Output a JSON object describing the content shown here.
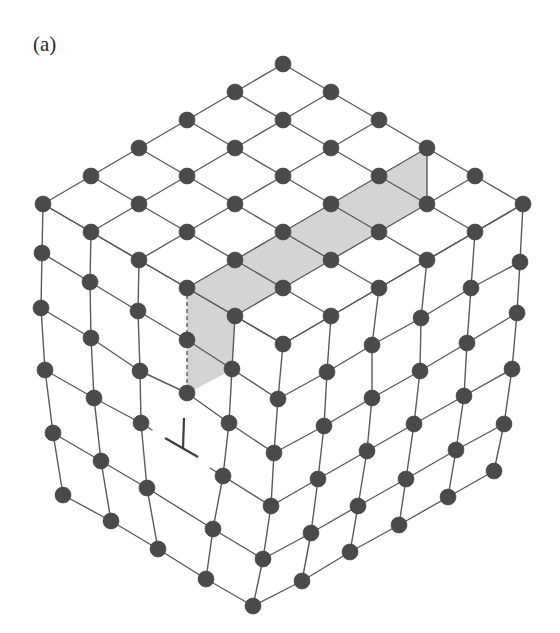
{
  "figure": {
    "panel_label": "(a)",
    "dislocation_symbol": "⊥"
  },
  "colors": {
    "atom": "#4a4a4a",
    "bond": "#5a5a5a",
    "half_plane_shade": "#d4d4d4",
    "background": "#ffffff"
  },
  "lattice": {
    "atom_radius": 8,
    "top_face": {
      "origin": [
        283,
        64
      ],
      "step_i": [
        -48,
        28
      ],
      "step_j": [
        48,
        28
      ],
      "size": 6
    },
    "left_face_rows": [
      [
        [
          43,
          204
        ],
        [
          91,
          232
        ],
        [
          139,
          260
        ],
        [
          187,
          288
        ],
        [
          235,
          316
        ],
        [
          283,
          344
        ]
      ],
      [
        [
          42,
          253
        ],
        [
          90,
          282
        ],
        [
          138,
          311
        ],
        [
          187,
          340
        ],
        [
          232,
          369
        ],
        [
          278,
          399
        ]
      ],
      [
        [
          41,
          308
        ],
        [
          91,
          338
        ],
        [
          140,
          371
        ],
        [
          187,
          393
        ],
        [
          229,
          423
        ],
        [
          274,
          453
        ]
      ],
      [
        [
          45,
          370
        ],
        [
          94,
          398
        ],
        [
          141,
          423
        ]
      ],
      [
        [
          223,
          476
        ],
        [
          271,
          506
        ]
      ],
      [
        [
          53,
          433
        ],
        [
          101,
          461
        ],
        [
          147,
          488
        ],
        [
          213,
          529
        ],
        [
          263,
          559
        ]
      ],
      [
        [
          63,
          495
        ],
        [
          111,
          521
        ],
        [
          158,
          549
        ],
        [
          206,
          579
        ],
        [
          253,
          606
        ]
      ]
    ],
    "left_face_columns": [
      [
        [
          43,
          204
        ],
        [
          42,
          253
        ],
        [
          41,
          308
        ],
        [
          45,
          370
        ],
        [
          53,
          433
        ],
        [
          63,
          495
        ]
      ],
      [
        [
          91,
          232
        ],
        [
          90,
          282
        ],
        [
          91,
          338
        ],
        [
          94,
          398
        ],
        [
          101,
          461
        ],
        [
          111,
          521
        ]
      ],
      [
        [
          139,
          260
        ],
        [
          138,
          311
        ],
        [
          140,
          371
        ],
        [
          141,
          423
        ],
        [
          147,
          488
        ],
        [
          158,
          549
        ]
      ],
      [
        [
          235,
          316
        ],
        [
          232,
          369
        ],
        [
          229,
          423
        ],
        [
          223,
          476
        ],
        [
          213,
          529
        ],
        [
          206,
          579
        ]
      ]
    ],
    "half_plane_column": [
      [
        187,
        288
      ],
      [
        187,
        340
      ],
      [
        187,
        393
      ]
    ],
    "stubs": [
      [
        [
          141,
          423
        ],
        [
          152,
          430
        ]
      ],
      [
        [
          223,
          476
        ],
        [
          210,
          468
        ]
      ]
    ],
    "right_face_rows": [
      [
        [
          283,
          344
        ],
        [
          331,
          316
        ],
        [
          379,
          288
        ],
        [
          427,
          260
        ],
        [
          475,
          232
        ],
        [
          523,
          204
        ]
      ],
      [
        [
          278,
          399
        ],
        [
          327,
          372
        ],
        [
          372,
          345
        ],
        [
          421,
          318
        ],
        [
          471,
          288
        ],
        [
          520,
          262
        ]
      ],
      [
        [
          274,
          453
        ],
        [
          324,
          426
        ],
        [
          372,
          398
        ],
        [
          420,
          371
        ],
        [
          467,
          343
        ],
        [
          517,
          313
        ]
      ],
      [
        [
          271,
          506
        ],
        [
          318,
          479
        ],
        [
          367,
          451
        ],
        [
          414,
          424
        ],
        [
          464,
          396
        ],
        [
          512,
          369
        ]
      ],
      [
        [
          263,
          559
        ],
        [
          311,
          533
        ],
        [
          358,
          506
        ],
        [
          406,
          479
        ],
        [
          456,
          450
        ],
        [
          504,
          424
        ]
      ],
      [
        [
          253,
          606
        ],
        [
          302,
          581
        ],
        [
          350,
          552
        ],
        [
          399,
          525
        ],
        [
          448,
          497
        ],
        [
          494,
          471
        ]
      ]
    ],
    "half_plane_regions": [
      [
        [
          427,
          148
        ],
        [
          427,
          204
        ],
        [
          235,
          316
        ],
        [
          187,
          288
        ],
        [
          379,
          176
        ]
      ],
      [
        [
          187,
          288
        ],
        [
          235,
          316
        ],
        [
          232,
          369
        ],
        [
          224,
          374
        ],
        [
          190,
          392
        ],
        [
          187,
          393
        ]
      ]
    ],
    "half_plane_back_edge": [
      [
        427,
        148
      ],
      [
        427,
        204
      ]
    ],
    "dashed_edge": [
      [
        187,
        288
      ],
      [
        187,
        393
      ]
    ],
    "dislocation_marker": {
      "stem": [
        [
          184,
          418
        ],
        [
          183,
          449
        ]
      ],
      "bar": [
        [
          165,
          438
        ],
        [
          198,
          457
        ]
      ]
    }
  }
}
